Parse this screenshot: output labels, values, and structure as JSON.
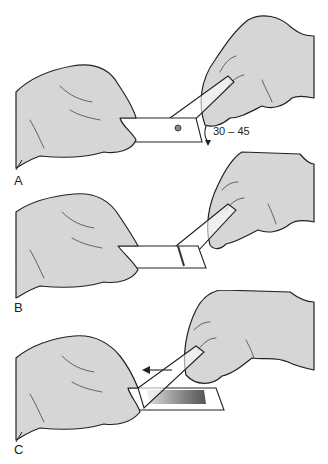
{
  "figure": {
    "panels": [
      {
        "label": "A",
        "angle_annotation": "30 – 45",
        "description": "Spreader slide placed at 30–45 degree angle in front of blood drop"
      },
      {
        "label": "B",
        "description": "Spreader slide drawn back into drop; blood spreads along edge"
      },
      {
        "label": "C",
        "description": "Spreader slide pushed forward producing smear",
        "arrow_direction": "left"
      }
    ],
    "colors": {
      "glove_fill": "#d6d6d6",
      "outline": "#222222",
      "smear_dark": "#555555",
      "smear_light": "#e0e0e0"
    }
  }
}
